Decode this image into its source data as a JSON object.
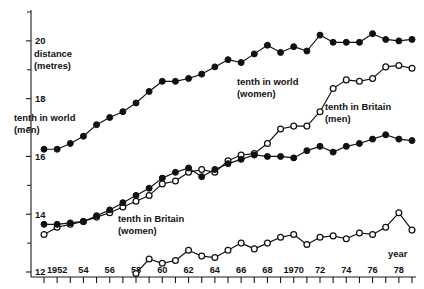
{
  "chart_data": {
    "type": "line",
    "title": "",
    "xlabel": "year",
    "ylabel": "distance (metres)",
    "xlim": [
      1951,
      1979
    ],
    "ylim": [
      12,
      21
    ],
    "grid": false,
    "legend_position": "inline-annotations",
    "y_ticks_major": [
      12,
      14,
      16,
      18,
      20
    ],
    "y_ticks_major_labels": [
      "12",
      "14",
      "16",
      "18",
      "20"
    ],
    "y_ticks_minor": [
      13,
      15,
      17,
      19,
      21
    ],
    "x_ticks": [
      1951,
      1952,
      1953,
      1954,
      1955,
      1956,
      1957,
      1958,
      1959,
      1960,
      1961,
      1962,
      1963,
      1964,
      1965,
      1966,
      1967,
      1968,
      1969,
      1970,
      1971,
      1972,
      1973,
      1974,
      1975,
      1976,
      1977,
      1978,
      1979
    ],
    "x_tick_labels": [
      {
        "year": 1952,
        "label": "1952"
      },
      {
        "year": 1954,
        "label": "54"
      },
      {
        "year": 1956,
        "label": "56"
      },
      {
        "year": 1958,
        "label": "58"
      },
      {
        "year": 1960,
        "label": "60"
      },
      {
        "year": 1962,
        "label": "62"
      },
      {
        "year": 1964,
        "label": "64"
      },
      {
        "year": 1966,
        "label": "66"
      },
      {
        "year": 1968,
        "label": "68"
      },
      {
        "year": 1970,
        "label": "1970"
      },
      {
        "year": 1972,
        "label": "72"
      },
      {
        "year": 1974,
        "label": "74"
      },
      {
        "year": 1976,
        "label": "76"
      },
      {
        "year": 1978,
        "label": "78"
      }
    ],
    "series": [
      {
        "name": "tenth in world (men)",
        "label_line1": "tenth in world",
        "label_line2": "(men)",
        "marker": "filled-circle",
        "x": [
          1951,
          1952,
          1953,
          1954,
          1955,
          1956,
          1957,
          1958,
          1959,
          1960,
          1961,
          1962,
          1963,
          1964,
          1965,
          1966,
          1967,
          1968,
          1969,
          1970,
          1971,
          1972,
          1973,
          1974,
          1975,
          1976,
          1977,
          1978,
          1979
        ],
        "values": [
          16.25,
          16.25,
          16.45,
          16.7,
          17.1,
          17.35,
          17.55,
          17.85,
          18.25,
          18.6,
          18.6,
          18.7,
          18.85,
          19.1,
          19.35,
          19.25,
          19.55,
          19.85,
          19.6,
          19.8,
          19.65,
          20.2,
          19.95,
          19.95,
          19.95,
          20.25,
          20.05,
          20.0,
          20.05
        ]
      },
      {
        "name": "tenth in world (women)",
        "label_line1": "tenth in world",
        "label_line2": "(women)",
        "marker": "open-circle",
        "x": [
          1951,
          1952,
          1953,
          1954,
          1955,
          1956,
          1957,
          1958,
          1959,
          1960,
          1961,
          1962,
          1963,
          1964,
          1965,
          1966,
          1967,
          1968,
          1969,
          1970,
          1971,
          1972,
          1973,
          1974,
          1975,
          1976,
          1977,
          1978,
          1979
        ],
        "values": [
          13.3,
          13.55,
          13.65,
          13.75,
          13.9,
          14.05,
          14.25,
          14.45,
          14.65,
          15.05,
          15.15,
          15.45,
          15.55,
          15.45,
          15.85,
          16.05,
          16.1,
          16.45,
          16.95,
          17.05,
          17.05,
          17.55,
          18.35,
          18.65,
          18.6,
          18.7,
          19.1,
          19.15,
          19.05
        ]
      },
      {
        "name": "tenth in Britain (men)",
        "label_line1": "tenth in Britain",
        "label_line2": "(men)",
        "marker": "filled-circle",
        "x": [
          1951,
          1952,
          1953,
          1954,
          1955,
          1956,
          1957,
          1958,
          1959,
          1960,
          1961,
          1962,
          1963,
          1964,
          1965,
          1966,
          1967,
          1968,
          1969,
          1970,
          1971,
          1972,
          1973,
          1974,
          1975,
          1976,
          1977,
          1978,
          1979
        ],
        "values": [
          13.65,
          13.65,
          13.7,
          13.75,
          13.95,
          14.15,
          14.4,
          14.65,
          14.9,
          15.25,
          15.45,
          15.6,
          15.3,
          15.55,
          15.75,
          15.9,
          16.05,
          16.0,
          16.0,
          15.95,
          16.2,
          16.35,
          16.15,
          16.35,
          16.45,
          16.6,
          16.75,
          16.6,
          16.55
        ]
      },
      {
        "name": "tenth in Britain (women)",
        "label_line1": "tenth in Britain",
        "label_line2": "(women)",
        "marker": "open-circle",
        "x": [
          1958,
          1959,
          1960,
          1961,
          1962,
          1963,
          1964,
          1965,
          1966,
          1967,
          1968,
          1969,
          1970,
          1971,
          1972,
          1973,
          1974,
          1975,
          1976,
          1977,
          1978,
          1979
        ],
        "values": [
          11.95,
          12.45,
          12.3,
          12.4,
          12.75,
          12.55,
          12.5,
          12.75,
          13.0,
          12.8,
          13.0,
          13.2,
          13.3,
          12.95,
          13.2,
          13.25,
          13.15,
          13.35,
          13.3,
          13.55,
          14.05,
          13.45
        ]
      }
    ],
    "annotations": [
      {
        "id": "world-men",
        "text_line1": "tenth in world",
        "text_line2": "(men)",
        "x_px": 14,
        "y_px": 121
      },
      {
        "id": "world-women",
        "text_line1": "tenth in world",
        "text_line2": "(women)",
        "x_px": 237,
        "y_px": 85
      },
      {
        "id": "britain-men",
        "text_line1": "tenth in Britain",
        "text_line2": "(men)",
        "x_px": 325,
        "y_px": 110
      },
      {
        "id": "britain-women",
        "text_line1": "tenth in Britain",
        "text_line2": "(women)",
        "x_px": 118,
        "y_px": 222
      },
      {
        "id": "y-axis-title",
        "text_line1": "distance",
        "text_line2": "(metres)",
        "x_px": 34,
        "y_px": 57
      },
      {
        "id": "x-axis-title",
        "text_line1": "year",
        "text_line2": "",
        "x_px": 388,
        "y_px": 257
      }
    ]
  }
}
